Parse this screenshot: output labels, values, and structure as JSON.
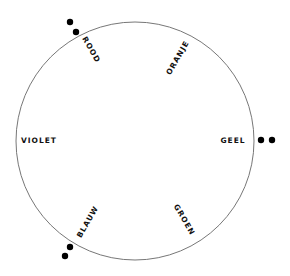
{
  "diagram": {
    "type": "color-wheel",
    "circle": {
      "cx": 135,
      "cy": 141,
      "r": 119,
      "stroke": "#777777"
    },
    "labels": [
      {
        "key": "rood",
        "text": "ROOD",
        "x": 91,
        "y": 50,
        "rotate": 60
      },
      {
        "key": "oranje",
        "text": "ORANJE",
        "x": 178,
        "y": 58,
        "rotate": -60
      },
      {
        "key": "geel",
        "text": "GEEL",
        "x": 233,
        "y": 141,
        "rotate": 0
      },
      {
        "key": "groen",
        "text": "GROEN",
        "x": 184,
        "y": 220,
        "rotate": 60
      },
      {
        "key": "blauw",
        "text": "BLAUW",
        "x": 88,
        "y": 222,
        "rotate": -60
      },
      {
        "key": "violet",
        "text": "VIOLET",
        "x": 39,
        "y": 141,
        "rotate": 0
      }
    ],
    "markers": [
      {
        "key": "rood-dot-1",
        "cx": 70,
        "cy": 22,
        "r": 3.2
      },
      {
        "key": "rood-dot-2",
        "cx": 76,
        "cy": 32,
        "r": 3.2
      },
      {
        "key": "geel-dot-1",
        "cx": 261,
        "cy": 140,
        "r": 3.2
      },
      {
        "key": "geel-dot-2",
        "cx": 272,
        "cy": 140,
        "r": 3.2
      },
      {
        "key": "blauw-dot-1",
        "cx": 70,
        "cy": 247,
        "r": 3.2
      },
      {
        "key": "blauw-dot-2",
        "cx": 65,
        "cy": 256,
        "r": 3.2
      }
    ],
    "marker_color": "#000000"
  }
}
